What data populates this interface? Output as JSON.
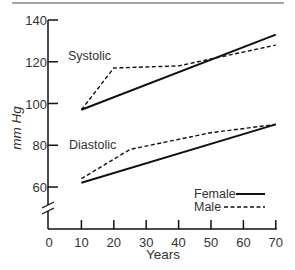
{
  "chart_data": {
    "type": "line",
    "title": "",
    "xlabel": "Years",
    "ylabel": "mm Hg",
    "xlim": [
      0,
      70
    ],
    "ylim": [
      50,
      140
    ],
    "x_ticks": [
      "0",
      "10",
      "20",
      "30",
      "40",
      "50",
      "60",
      "70"
    ],
    "y_ticks": [
      "60",
      "80",
      "100",
      "120",
      "140"
    ],
    "y_axis_break": true,
    "grid": false,
    "legend": {
      "position": "lower right",
      "entries": [
        {
          "label": "Female",
          "style": "solid"
        },
        {
          "label": "Male",
          "style": "dashed"
        }
      ]
    },
    "annotations": [
      {
        "text": "Systolic",
        "x": 13,
        "y": 125
      },
      {
        "text": "Diastolic",
        "x": 13,
        "y": 81
      }
    ],
    "series": [
      {
        "name": "Systolic Female",
        "group": "Systolic",
        "sex": "Female",
        "style": "solid",
        "x": [
          10,
          70
        ],
        "y": [
          97,
          133
        ]
      },
      {
        "name": "Systolic Male",
        "group": "Systolic",
        "sex": "Male",
        "style": "dashed",
        "x": [
          10,
          20,
          40,
          70
        ],
        "y": [
          97,
          117,
          118,
          128
        ]
      },
      {
        "name": "Diastolic Female",
        "group": "Diastolic",
        "sex": "Female",
        "style": "solid",
        "x": [
          10,
          70
        ],
        "y": [
          62,
          90
        ]
      },
      {
        "name": "Diastolic Male",
        "group": "Diastolic",
        "sex": "Male",
        "style": "dashed",
        "x": [
          10,
          25,
          50,
          70
        ],
        "y": [
          64,
          78,
          86,
          90
        ]
      }
    ]
  },
  "labels": {
    "systolic": "Systolic",
    "diastolic": "Diastolic",
    "legend_female": "Female",
    "legend_male": "Male",
    "xlabel": "Years",
    "ylabel": "mm Hg"
  }
}
